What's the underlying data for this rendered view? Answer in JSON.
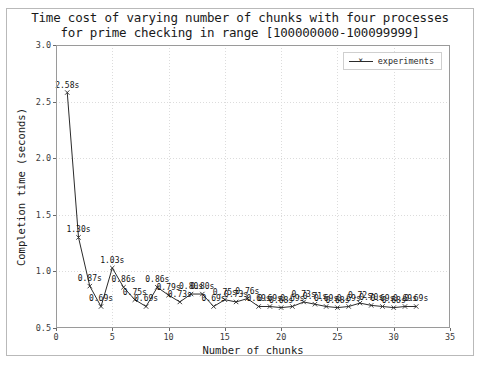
{
  "figure": {
    "title_line1": "Time cost of varying number of chunks with four processes",
    "title_line2": "for prime checking in range [100000000-100099999]"
  },
  "legend": {
    "position": "upper right",
    "entries": [
      {
        "label": "experiments",
        "color": "#2b2b2b",
        "marker": "x"
      }
    ]
  },
  "axes": {
    "xlabel": "Number of chunks",
    "ylabel": "Completion time (seconds)",
    "xticks": [
      "0",
      "5",
      "10",
      "15",
      "20",
      "25",
      "30",
      "35"
    ],
    "yticks": [
      "0.5",
      "1.0",
      "1.5",
      "2.0",
      "2.5",
      "3.0"
    ]
  },
  "chart_data": {
    "type": "line",
    "title": "Time cost of varying number of chunks with four processes for prime checking in range [100000000-100099999]",
    "xlabel": "Number of chunks",
    "ylabel": "Completion time (seconds)",
    "xlim": [
      0,
      35
    ],
    "ylim": [
      0.5,
      3.0
    ],
    "xticks": [
      0,
      5,
      10,
      15,
      20,
      25,
      30,
      35
    ],
    "yticks": [
      0.5,
      1.0,
      1.5,
      2.0,
      2.5,
      3.0
    ],
    "grid": true,
    "legend_position": "upper right",
    "series": [
      {
        "name": "experiments",
        "color": "#2b2b2b",
        "marker": "x",
        "x": [
          1,
          2,
          3,
          4,
          5,
          6,
          7,
          8,
          9,
          10,
          11,
          12,
          13,
          14,
          15,
          16,
          17,
          18,
          19,
          20,
          21,
          22,
          23,
          24,
          25,
          26,
          27,
          28,
          29,
          30,
          31,
          32
        ],
        "values": [
          2.58,
          1.3,
          0.87,
          0.69,
          1.03,
          0.86,
          0.75,
          0.69,
          0.86,
          0.79,
          0.73,
          0.8,
          0.8,
          0.69,
          0.75,
          0.73,
          0.76,
          0.69,
          0.69,
          0.68,
          0.69,
          0.73,
          0.71,
          0.69,
          0.68,
          0.69,
          0.72,
          0.7,
          0.69,
          0.68,
          0.69,
          0.69
        ],
        "point_labels": [
          "2.58s",
          "1.30s",
          "0.87s",
          "0.69s",
          "1.03s",
          "0.86s",
          "0.75s",
          "0.69s",
          "0.86s",
          "0.79s",
          "0.73s",
          "0.80s",
          "0.80s",
          "0.69s",
          "0.75s",
          "0.73s",
          "0.76s",
          "0.69s",
          "0.69s",
          "0.68s",
          "0.69s",
          "0.73s",
          "0.71s",
          "0.69s",
          "0.68s",
          "0.69s",
          "0.72s",
          "0.70s",
          "0.69s",
          "0.68s",
          "0.69s",
          "0.69s"
        ]
      }
    ]
  }
}
